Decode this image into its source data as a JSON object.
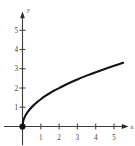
{
  "chart_data": {
    "type": "line",
    "title": "",
    "subtitle": "",
    "xlabel": "x",
    "ylabel": "y",
    "xlim": [
      -0.35,
      6.0
    ],
    "ylim": [
      -0.35,
      5.9
    ],
    "grid": false,
    "legend": null,
    "x_ticks": [
      1,
      2,
      3,
      4,
      5
    ],
    "y_ticks": [
      1,
      2,
      3,
      4,
      5
    ],
    "x_tick_labels": [
      "1",
      "2",
      "3",
      "4",
      "5"
    ],
    "y_tick_labels": [
      "1",
      "2",
      "3",
      "4",
      "5"
    ],
    "axis_arrows": true,
    "series": [
      {
        "name": "curve",
        "color": "#131313",
        "x": [
          0.0,
          0.05,
          0.1,
          0.2,
          0.3,
          0.45,
          0.6,
          0.8,
          1.0,
          1.25,
          1.5,
          1.75,
          2.0,
          2.5,
          3.0,
          3.5,
          4.0,
          4.5,
          5.0,
          5.5
        ],
        "y": [
          0.0,
          0.32,
          0.45,
          0.64,
          0.78,
          0.95,
          1.1,
          1.27,
          1.42,
          1.59,
          1.74,
          1.88,
          2.0,
          2.24,
          2.45,
          2.65,
          2.83,
          3.0,
          3.16,
          3.32
        ]
      }
    ],
    "markers": [
      {
        "name": "origin-point",
        "x": 0,
        "y": 0,
        "style": "filled-circle",
        "color": "#111111"
      }
    ],
    "colors": {
      "curve": "#131313",
      "axis": "#3a3a3a",
      "tick_label": "#3c3c3c",
      "background": "#ffffff"
    }
  }
}
